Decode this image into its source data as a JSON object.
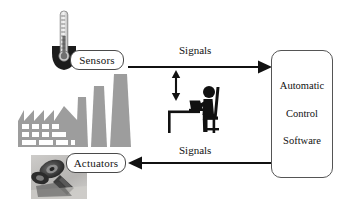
{
  "diagram": {
    "background_color": "#ffffff",
    "width": 350,
    "height": 202,
    "nodes": [
      {
        "id": "sensors",
        "label": "Sensors",
        "shape": "rounded-rect",
        "border_color": "#4a4a4a",
        "fill_color": "#ffffff"
      },
      {
        "id": "actuators",
        "label": "Actuators",
        "shape": "rounded-rect",
        "border_color": "#4a4a4a",
        "fill_color": "#ffffff"
      },
      {
        "id": "controller",
        "shape": "rounded-rect",
        "border_color": "#555555",
        "fill_color": "#ffffff",
        "lines": [
          "Automatic",
          "Control",
          "Software"
        ]
      }
    ],
    "edges": [
      {
        "id": "sensors-to-controller",
        "label": "Signals",
        "direction": "right",
        "from": "sensors",
        "to": "controller",
        "color": "#111111"
      },
      {
        "id": "controller-to-actuators",
        "label": "Signals",
        "direction": "left",
        "from": "controller",
        "to": "actuators",
        "color": "#111111"
      },
      {
        "id": "operator-interaction",
        "label": "",
        "direction": "both",
        "from": "operator",
        "to": "sensors-to-controller",
        "color": "#111111"
      }
    ],
    "illustrations": [
      {
        "id": "thermometer",
        "icon": "thermometer-icon",
        "color": "#4d4d4d"
      },
      {
        "id": "factory",
        "icon": "factory-icon",
        "color": "#9a9a9a"
      },
      {
        "id": "actuator-photo",
        "icon": "robot-actuator-photo",
        "color": "#6b6b6b"
      },
      {
        "id": "operator",
        "icon": "person-at-laptop-icon",
        "color": "#111111"
      }
    ]
  }
}
